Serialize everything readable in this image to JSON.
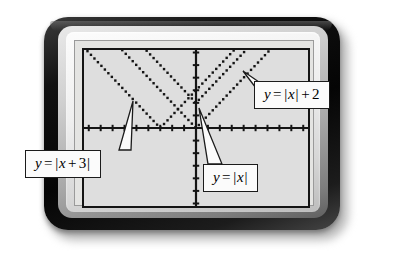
{
  "device": {
    "kind": "graphing-calculator",
    "bezel_color": "#0a0a0a",
    "inner_frame_color": "#d7d7d7",
    "screen_color": "#dedede",
    "ink_color": "#141414"
  },
  "callouts": [
    {
      "id": "abs-plus2",
      "text": "y = |x| + 2",
      "lhs": "y",
      "eq": "=",
      "expr_open": "|",
      "expr_var": "x",
      "expr_close": "|",
      "expr_op": "+",
      "expr_const": "2",
      "anchor_x": 243,
      "anchor_y": 71
    },
    {
      "id": "abs-shift3",
      "text": "y = |x + 3|",
      "lhs": "y",
      "eq": "=",
      "expr_open": "|",
      "expr_var": "x",
      "expr_op": "+",
      "expr_const": "3",
      "expr_close": "|",
      "anchor_x": 133,
      "anchor_y": 101
    },
    {
      "id": "abs-x",
      "text": "y = |x|",
      "lhs": "y",
      "eq": "=",
      "expr_open": "|",
      "expr_var": "x",
      "expr_close": "|",
      "anchor_x": 199,
      "anchor_y": 108
    }
  ],
  "chart_data": {
    "type": "line",
    "title": "",
    "subtitle": "",
    "xlabel": "",
    "ylabel": "",
    "xlim": [
      -9.4,
      9.4
    ],
    "ylim": [
      -6.2,
      6.2
    ],
    "grid": false,
    "axes": {
      "x_axis": true,
      "y_axis": true,
      "tick_spacing_x": 1,
      "tick_spacing_y": 1,
      "tick_marks": true
    },
    "legend": "callout-labels",
    "render_style": "pixelated-dotted",
    "series": [
      {
        "name": "y = |x|",
        "expression": "y = |x|",
        "vertex": [
          0,
          0
        ],
        "slope_left": -1,
        "slope_right": 1,
        "x": [
          -9.4,
          0,
          9.4
        ],
        "values": [
          9.4,
          0,
          9.4
        ]
      },
      {
        "name": "y = |x| + 2",
        "expression": "y = |x| + 2",
        "vertex": [
          0,
          2
        ],
        "slope_left": -1,
        "slope_right": 1,
        "x": [
          -9.4,
          0,
          9.4
        ],
        "values": [
          11.4,
          2,
          11.4
        ]
      },
      {
        "name": "y = |x + 3|",
        "expression": "y = |x + 3|",
        "vertex": [
          -3,
          0
        ],
        "slope_left": -1,
        "slope_right": 1,
        "x": [
          -9.4,
          -3,
          9.4
        ],
        "values": [
          6.4,
          0,
          12.4
        ]
      }
    ]
  }
}
